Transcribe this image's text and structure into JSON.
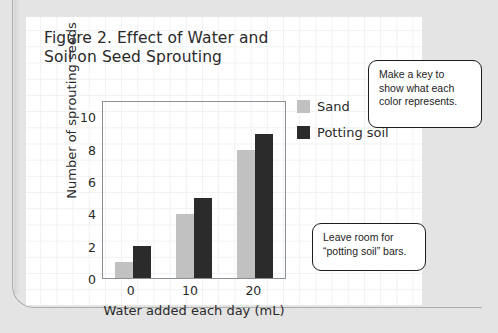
{
  "figure": {
    "title": "Figure 2. Effect of Water and\nSoil on Seed Sprouting"
  },
  "chart_data": {
    "type": "bar",
    "title": "Figure 2. Effect of Water and Soil on Seed Sprouting",
    "xlabel": "Water added each day (mL)",
    "ylabel": "Number of sprouting seeds",
    "categories": [
      "0",
      "10",
      "20"
    ],
    "series": [
      {
        "name": "Sand",
        "color": "#c1c1c1",
        "values": [
          1,
          4,
          8
        ]
      },
      {
        "name": "Potting soil",
        "color": "#2b2b2b",
        "values": [
          2,
          5,
          9
        ]
      }
    ],
    "ylim": [
      0,
      11
    ],
    "yticks": [
      0,
      2,
      4,
      6,
      8,
      10
    ],
    "xticks": [
      "0",
      "10",
      "20"
    ],
    "grid": false,
    "legend_position": "right"
  },
  "legend": {
    "items": [
      {
        "label": "Sand",
        "color": "#c1c1c1"
      },
      {
        "label": "Potting soil",
        "color": "#2b2b2b"
      }
    ]
  },
  "callouts": [
    {
      "text": "Make a key to\nshow what each\ncolor represents."
    },
    {
      "text": "Leave room for\n“potting soil” bars."
    }
  ],
  "colors": {
    "sand": "#c1c1c1",
    "potting_soil": "#2b2b2b",
    "axis": "#8b8f96",
    "paper": "#ffffff",
    "background": "#e4e4e4",
    "grid_line": "#f0f1f3",
    "text": "#2a2a2a"
  }
}
